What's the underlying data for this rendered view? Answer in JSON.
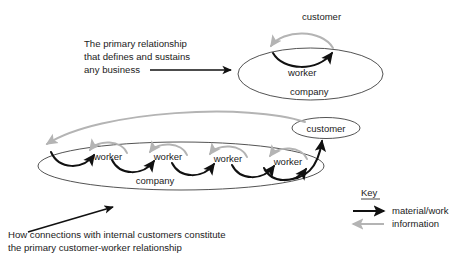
{
  "diagram": {
    "title_text_top": {
      "lines": [
        "The primary relationship",
        "that defines and sustains",
        "any business"
      ]
    },
    "caption_bottom": {
      "lines": [
        "How connections with internal customers constitute",
        "the primary customer-worker relationship"
      ]
    },
    "top_model": {
      "company_label": "company",
      "worker_label": "worker",
      "customer_label": "customer"
    },
    "bottom_model": {
      "company_label": "company",
      "customer_label": "customer",
      "workers": [
        {
          "label": "worker"
        },
        {
          "label": "worker"
        },
        {
          "label": "worker"
        },
        {
          "label": "worker"
        }
      ]
    },
    "key": {
      "title": "Key",
      "items": [
        {
          "label": "material/work",
          "color": "#111111",
          "direction": "right"
        },
        {
          "label": "information",
          "color": "#b4b4b4",
          "direction": "left"
        }
      ]
    },
    "colors": {
      "material_work": "#111111",
      "information": "#b4b4b4",
      "outline": "#3f3f3f",
      "text": "#1b1b1b",
      "background": "#ffffff"
    }
  }
}
